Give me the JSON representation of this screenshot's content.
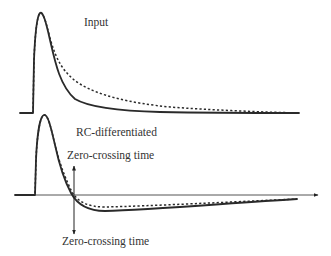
{
  "figure": {
    "type": "pulse-shaping-diagram",
    "labels": {
      "input": "Input",
      "rc_differentiated": "RC-differentiated",
      "zero_crossing_top": "Zero-crossing time",
      "zero_crossing_bottom": "Zero-crossing time"
    },
    "panels": [
      {
        "name": "input",
        "label": "Input",
        "curves": [
          {
            "style": "solid",
            "description": "input pulse, faster decay"
          },
          {
            "style": "dashed",
            "description": "input pulse, slower decay"
          }
        ]
      },
      {
        "name": "rc-differentiated",
        "label": "RC-differentiated",
        "curves": [
          {
            "style": "solid",
            "description": "differentiated pulse with undershoot"
          },
          {
            "style": "dashed",
            "description": "differentiated pulse with undershoot"
          }
        ],
        "annotation": "Zero-crossing time",
        "has_time_axis": true
      }
    ],
    "colors": {
      "curve": "#2a2a2a",
      "axis": "#555555",
      "text": "#333333",
      "background": "#ffffff"
    }
  }
}
